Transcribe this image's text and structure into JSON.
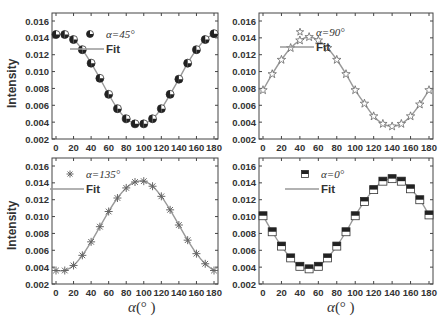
{
  "chart_data": [
    {
      "type": "scatter",
      "panel": "top-left",
      "legend": [
        "α=45°",
        "Fit"
      ],
      "ylabel": "Intensity",
      "xlabel": "",
      "xlim": [
        0,
        180
      ],
      "ylim": [
        0.002,
        0.016
      ],
      "xticks": [
        0,
        20,
        40,
        60,
        80,
        100,
        120,
        140,
        160,
        180
      ],
      "yticks": [
        0.002,
        0.004,
        0.006,
        0.008,
        0.01,
        0.012,
        0.014,
        0.016
      ],
      "marker": "half-filled-circle",
      "x": [
        0,
        10,
        20,
        30,
        40,
        50,
        60,
        70,
        80,
        90,
        100,
        110,
        120,
        130,
        140,
        150,
        160,
        170,
        180
      ],
      "values": [
        0.0144,
        0.0144,
        0.0138,
        0.0126,
        0.011,
        0.0092,
        0.0073,
        0.0056,
        0.0044,
        0.0038,
        0.0038,
        0.0044,
        0.0056,
        0.0073,
        0.0091,
        0.011,
        0.0126,
        0.0138,
        0.0145
      ]
    },
    {
      "type": "scatter",
      "panel": "top-right",
      "legend": [
        "α=90°",
        "Fit"
      ],
      "ylabel": "",
      "xlabel": "",
      "xlim": [
        0,
        180
      ],
      "ylim": [
        0.002,
        0.016
      ],
      "xticks": [
        0,
        20,
        40,
        60,
        80,
        100,
        120,
        140,
        160,
        180
      ],
      "yticks": [
        0.002,
        0.004,
        0.006,
        0.008,
        0.01,
        0.012,
        0.014,
        0.016
      ],
      "marker": "star",
      "x": [
        0,
        10,
        20,
        30,
        40,
        50,
        60,
        70,
        80,
        90,
        100,
        110,
        120,
        130,
        140,
        150,
        160,
        170,
        180
      ],
      "values": [
        0.0078,
        0.0097,
        0.0114,
        0.0128,
        0.0137,
        0.0141,
        0.0137,
        0.0128,
        0.0114,
        0.0097,
        0.0078,
        0.0062,
        0.0047,
        0.0038,
        0.0035,
        0.0038,
        0.0047,
        0.0061,
        0.0078
      ]
    },
    {
      "type": "scatter",
      "panel": "bottom-left",
      "legend": [
        "α=135°",
        "Fit"
      ],
      "ylabel": "Intensity",
      "xlabel": "α(° )",
      "xlim": [
        0,
        180
      ],
      "ylim": [
        0.002,
        0.016
      ],
      "xticks": [
        0,
        20,
        40,
        60,
        80,
        100,
        120,
        140,
        160,
        180
      ],
      "yticks": [
        0.002,
        0.004,
        0.006,
        0.008,
        0.01,
        0.012,
        0.014,
        0.016
      ],
      "marker": "asterisk",
      "x": [
        0,
        10,
        20,
        30,
        40,
        50,
        60,
        70,
        80,
        90,
        100,
        110,
        120,
        130,
        140,
        150,
        160,
        170,
        180
      ],
      "values": [
        0.0036,
        0.0036,
        0.0042,
        0.0054,
        0.007,
        0.0088,
        0.0106,
        0.0122,
        0.0134,
        0.0141,
        0.0142,
        0.0136,
        0.0124,
        0.0108,
        0.009,
        0.0072,
        0.0056,
        0.0044,
        0.0036
      ]
    },
    {
      "type": "scatter",
      "panel": "bottom-right",
      "legend": [
        "α=0°",
        "Fit"
      ],
      "ylabel": "",
      "xlabel": "α(° )",
      "xlim": [
        0,
        180
      ],
      "ylim": [
        0.002,
        0.016
      ],
      "xticks": [
        0,
        20,
        40,
        60,
        80,
        100,
        120,
        140,
        160,
        180
      ],
      "yticks": [
        0.002,
        0.004,
        0.006,
        0.008,
        0.01,
        0.012,
        0.014,
        0.016
      ],
      "marker": "half-filled-square",
      "x": [
        0,
        10,
        20,
        30,
        40,
        50,
        60,
        70,
        80,
        90,
        100,
        110,
        120,
        130,
        140,
        150,
        160,
        170,
        180
      ],
      "values": [
        0.0101,
        0.0082,
        0.0065,
        0.0051,
        0.0041,
        0.0038,
        0.0041,
        0.0051,
        0.0065,
        0.0082,
        0.0101,
        0.0118,
        0.0132,
        0.0142,
        0.0145,
        0.0142,
        0.0133,
        0.012,
        0.0102
      ]
    }
  ],
  "labels": {
    "intensity": "Intensity",
    "xaxis": "α(° )",
    "fit": "Fit",
    "alpha45": "α=45°",
    "alpha90": "α=90°",
    "alpha135": "α=135°",
    "alpha0": "α=0°"
  },
  "ytick_labels": [
    "0.002",
    "0.004",
    "0.006",
    "0.008",
    "0.010",
    "0.012",
    "0.014",
    "0.016"
  ],
  "xtick_labels": [
    "0",
    "20",
    "40",
    "60",
    "80",
    "100",
    "120",
    "140",
    "160",
    "180"
  ]
}
